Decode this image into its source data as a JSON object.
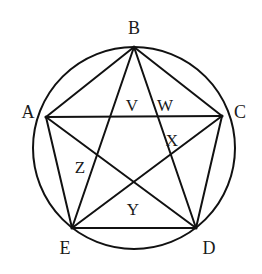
{
  "figure": {
    "type": "geometry-diagram",
    "background_color": "#ffffff",
    "stroke_color": "#111111",
    "stroke_width": 2,
    "canvas": {
      "width": 262,
      "height": 274
    },
    "circle": {
      "cx": 134,
      "cy": 148,
      "r": 101
    },
    "vertices": [
      {
        "id": "A",
        "label": "A",
        "point_x": 46,
        "point_y": 117,
        "label_x": 28,
        "label_y": 112
      },
      {
        "id": "B",
        "label": "B",
        "point_x": 134,
        "point_y": 47,
        "label_x": 134,
        "label_y": 28
      },
      {
        "id": "C",
        "label": "C",
        "point_x": 222,
        "point_y": 116,
        "label_x": 240,
        "label_y": 112
      },
      {
        "id": "D",
        "label": "D",
        "point_x": 196,
        "point_y": 228,
        "label_x": 209,
        "label_y": 248
      },
      {
        "id": "E",
        "label": "E",
        "point_x": 72,
        "point_y": 228,
        "label_x": 65,
        "label_y": 248
      }
    ],
    "region_labels": [
      {
        "id": "V",
        "label": "V",
        "label_x": 132,
        "label_y": 105
      },
      {
        "id": "W",
        "label": "W",
        "label_x": 165,
        "label_y": 105
      },
      {
        "id": "X",
        "label": "X",
        "label_x": 172,
        "label_y": 140
      },
      {
        "id": "Y",
        "label": "Y",
        "label_x": 133,
        "label_y": 209
      },
      {
        "id": "Z",
        "label": "Z",
        "label_x": 80,
        "label_y": 167
      }
    ],
    "edges": [
      {
        "from": "A",
        "to": "B"
      },
      {
        "from": "B",
        "to": "C"
      },
      {
        "from": "C",
        "to": "D"
      },
      {
        "from": "D",
        "to": "E"
      },
      {
        "from": "E",
        "to": "A"
      },
      {
        "from": "A",
        "to": "C"
      },
      {
        "from": "A",
        "to": "D"
      },
      {
        "from": "B",
        "to": "D"
      },
      {
        "from": "B",
        "to": "E"
      },
      {
        "from": "C",
        "to": "E"
      }
    ]
  }
}
